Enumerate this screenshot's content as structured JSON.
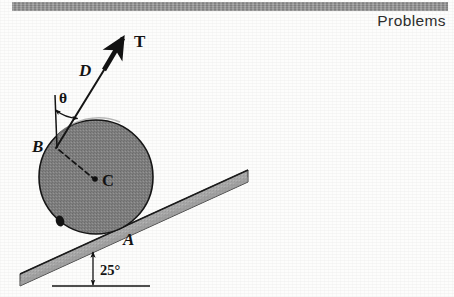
{
  "page": {
    "running_header": "Problems",
    "background_color": "#fdfdfc"
  },
  "figure": {
    "colors": {
      "cylinder_fill": "#808080",
      "cylinder_edge": "#1a1a1a",
      "incline_fill": "#a8a8a8",
      "incline_edge": "#1c1c1c",
      "header_bar": "#8f8f8f",
      "ink": "#141414"
    },
    "labels": {
      "tension": "T",
      "cord_point": "D",
      "theta": "θ",
      "tangent_point": "B",
      "center": "C",
      "contact_point": "A",
      "incline_angle": "25°"
    },
    "geometry": {
      "cylinder_center": [
        96,
        177
      ],
      "cylinder_radius": 57,
      "tangent_point_B": [
        56,
        147
      ],
      "contact_point_A": [
        120,
        233
      ],
      "cord_end_D": [
        103,
        69
      ],
      "arrow_tip_T": [
        126,
        33
      ],
      "incline_angle_deg": 25,
      "theta_arc_vertex": [
        56,
        147
      ]
    }
  }
}
